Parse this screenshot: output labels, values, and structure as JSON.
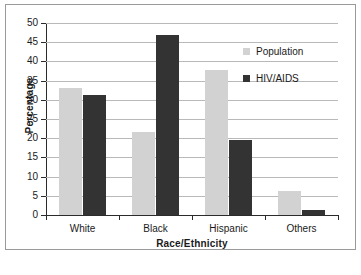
{
  "chart_data": {
    "type": "bar",
    "title": "",
    "xlabel": "Race/Ethnicity",
    "ylabel": "Percentage",
    "categories": [
      "White",
      "Black",
      "Hispanic",
      "Others"
    ],
    "series": [
      {
        "name": "Population",
        "color": "#d2d2d2",
        "values": [
          33.2,
          21.6,
          37.8,
          6.2
        ]
      },
      {
        "name": "HIV/AIDS",
        "color": "#333333",
        "values": [
          31.2,
          47.0,
          19.5,
          1.4
        ]
      }
    ],
    "ylim": [
      0,
      50
    ],
    "ytick_step": 5,
    "yticks": [
      50,
      45,
      40,
      35,
      30,
      25,
      20,
      15,
      10,
      5,
      0
    ],
    "ytick_labels": [
      "50",
      "45",
      "40",
      "35",
      "30",
      "25",
      "20",
      "15",
      "10",
      "5",
      "0"
    ],
    "grid": true,
    "grid_axis": "y",
    "legend_position": "upper right",
    "legend_entries": [
      "Population",
      "HIV/AIDS"
    ]
  }
}
